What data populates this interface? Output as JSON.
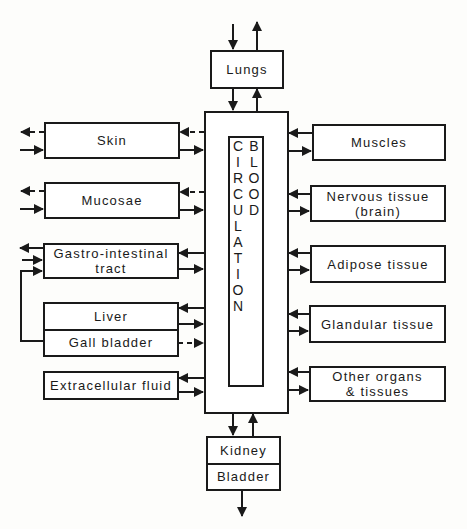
{
  "diagram": {
    "center": {
      "label": "BLOOD CIRCULATION"
    },
    "top": {
      "lungs": "Lungs"
    },
    "bottom": {
      "kidney": "Kidney",
      "bladder": "Bladder"
    },
    "left": {
      "skin": "Skin",
      "mucosae": "Mucosae",
      "gastro_line1": "Gastro-intestinal",
      "gastro_line2": "tract",
      "liver": "Liver",
      "gall_bladder": "Gall bladder",
      "extracellular": "Extracellular fluid"
    },
    "right": {
      "muscles": "Muscles",
      "nervous_line1": "Nervous tissue",
      "nervous_line2": "(brain)",
      "adipose": "Adipose tissue",
      "glandular": "Glandular tissue",
      "other_line1": "Other organs",
      "other_line2": "& tissues"
    },
    "colors": {
      "line": "#1a1a1a",
      "background": "#fdfdfb"
    }
  }
}
